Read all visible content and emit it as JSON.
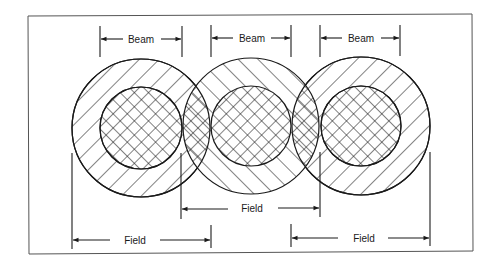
{
  "diagram": {
    "colors": {
      "line": "#1a1a1a",
      "frame": "#555555",
      "background": "#ffffff"
    },
    "beams": [
      {
        "label": "Beam",
        "x1": 100,
        "x2": 182
      },
      {
        "label": "Beam",
        "x1": 211,
        "x2": 291
      },
      {
        "label": "Beam",
        "x1": 320,
        "x2": 400
      }
    ],
    "fields": [
      {
        "label": "Field",
        "x1": 72,
        "x2": 211,
        "y": 240
      },
      {
        "label": "Field",
        "x1": 181,
        "x2": 320,
        "y": 209
      },
      {
        "label": "Field",
        "x1": 291,
        "x2": 430,
        "y": 238
      }
    ],
    "circles": [
      {
        "cx": 141,
        "cy": 128,
        "outer_r": 69,
        "inner_r": 41,
        "hatch": "backslash"
      },
      {
        "cx": 251,
        "cy": 126,
        "outer_r": 68,
        "inner_r": 40,
        "hatch": "slash"
      },
      {
        "cx": 361,
        "cy": 126,
        "outer_r": 69,
        "inner_r": 40,
        "hatch": "backslash"
      }
    ]
  }
}
